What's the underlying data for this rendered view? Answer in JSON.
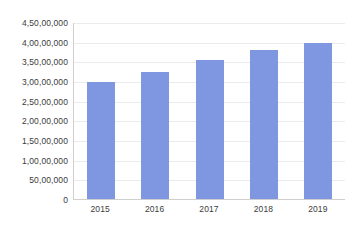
{
  "chart_data": {
    "type": "bar",
    "title": "",
    "subtitle": "",
    "xlabel": "",
    "ylabel": "",
    "categories": [
      "2015",
      "2016",
      "2017",
      "2018",
      "2019"
    ],
    "values": [
      29800000,
      32300000,
      35300000,
      37800000,
      39700000
    ],
    "value_labels": [
      "2,98,00,000",
      "3,23,00,000",
      "3,53,00,000",
      "3,78,00,000",
      "3,97,00,000"
    ],
    "series": [
      {
        "name": "",
        "values": [
          29800000,
          32300000,
          35300000,
          37800000,
          39700000
        ],
        "color": "#7f96e0"
      }
    ],
    "ylim": [
      0,
      45000000
    ],
    "ytick_values": [
      0,
      5000000,
      10000000,
      15000000,
      20000000,
      25000000,
      30000000,
      35000000,
      40000000,
      45000000
    ],
    "ytick_labels": [
      "0",
      "50,00,000",
      "1,00,00,000",
      "1,50,00,000",
      "2,00,00,000",
      "2,50,00,000",
      "3,00,00,000",
      "3,50,00,000",
      "4,00,00,000",
      "4,50,00,000"
    ],
    "number_format": "indian",
    "grid": {
      "horizontal": true,
      "vertical": false,
      "color": "#ebebeb"
    },
    "legend": {
      "visible": false,
      "position": "none",
      "entries": []
    },
    "annotations": [],
    "axis_line_color": "#cfcfcf",
    "background_color": "#ffffff",
    "tick_label_color": "#3b3b3b"
  }
}
